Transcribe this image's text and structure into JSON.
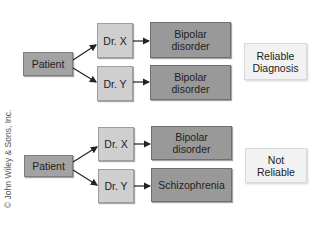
{
  "diagrams": [
    {
      "name": "reliable",
      "patient": "Patient",
      "doctor_x": "Dr. X",
      "doctor_y": "Dr. Y",
      "diagnosis_x": "Bipolar disorder",
      "diagnosis_y": "Bipolar disorder",
      "verdict": "Reliable Diagnosis"
    },
    {
      "name": "not-reliable",
      "patient": "Patient",
      "doctor_x": "Dr. X",
      "doctor_y": "Dr. Y",
      "diagnosis_x": "Bipolar disorder",
      "diagnosis_y": "Schizophrenia",
      "verdict": "Not Reliable"
    }
  ],
  "copyright": "© John Wiley & Sons, Inc.",
  "colors": {
    "patient_box": "#a3a3a3",
    "doctor_box": "#cfcfcf",
    "diagnosis_box": "#999999",
    "verdict_box": "#f2f2f2"
  }
}
